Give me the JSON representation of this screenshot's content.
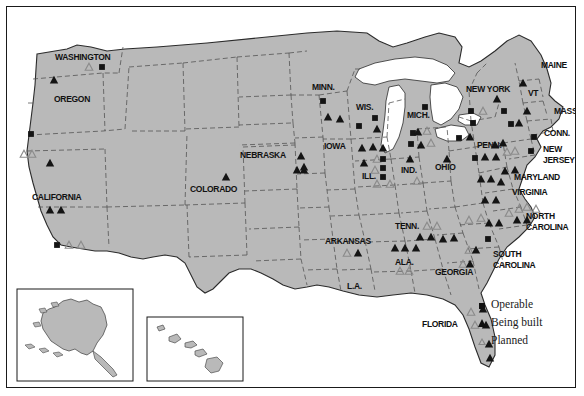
{
  "map": {
    "title": "Nuclear power plants in the United States",
    "land_color": "#b9b9b9",
    "water_color": "#ffffff",
    "outline_color": "#2b2b2b",
    "internal_border_color": "#4d4d4d",
    "frame_color": "#1a1a1a",
    "marker_fill": "#141414",
    "marker_outline": "#8a8a8a"
  },
  "legend": {
    "items": [
      {
        "icon": "filled-square-icon",
        "label": "Operable"
      },
      {
        "icon": "filled-triangle-icon",
        "label": "Being built"
      },
      {
        "icon": "outline-triangle-icon",
        "label": "Planned"
      }
    ]
  },
  "insets": [
    {
      "name": "alaska-inset",
      "label": ""
    },
    {
      "name": "hawaii-inset",
      "label": ""
    }
  ],
  "state_labels": [
    {
      "text": "WASHINGTON",
      "x": 48,
      "y": 53,
      "size": 8.5
    },
    {
      "text": "OREGON",
      "x": 47,
      "y": 95,
      "size": 8.5
    },
    {
      "text": "CALIFORNIA",
      "x": 25,
      "y": 193,
      "size": 8.5
    },
    {
      "text": "COLORADO",
      "x": 183,
      "y": 185,
      "size": 8.5
    },
    {
      "text": "NEBRASKA",
      "x": 233,
      "y": 151,
      "size": 8.5
    },
    {
      "text": "MINN.",
      "x": 305,
      "y": 83,
      "size": 8.5
    },
    {
      "text": "WIS.",
      "x": 349,
      "y": 103,
      "size": 8.5
    },
    {
      "text": "IOWA",
      "x": 317,
      "y": 142,
      "size": 8.5
    },
    {
      "text": "ILL.",
      "x": 355,
      "y": 172,
      "size": 8.5
    },
    {
      "text": "IND.",
      "x": 394,
      "y": 166,
      "size": 8.5
    },
    {
      "text": "OHIO",
      "x": 428,
      "y": 163,
      "size": 8.5
    },
    {
      "text": "MICH.",
      "x": 400,
      "y": 111,
      "size": 8.5
    },
    {
      "text": "ARKANSAS",
      "x": 318,
      "y": 237,
      "size": 8.5
    },
    {
      "text": "L.A.",
      "x": 340,
      "y": 282,
      "size": 8.5
    },
    {
      "text": "TENN.",
      "x": 388,
      "y": 222,
      "size": 8.5
    },
    {
      "text": "ALA.",
      "x": 388,
      "y": 258,
      "size": 8.5
    },
    {
      "text": "GEORGIA",
      "x": 428,
      "y": 268,
      "size": 8.5
    },
    {
      "text": "FLORIDA",
      "x": 415,
      "y": 320,
      "size": 8.5
    },
    {
      "text": "SOUTH",
      "x": 486,
      "y": 250,
      "size": 8.5
    },
    {
      "text": "CAROLINA",
      "x": 486,
      "y": 261,
      "size": 8.5
    },
    {
      "text": "NORTH",
      "x": 519,
      "y": 212,
      "size": 8.5
    },
    {
      "text": "CAROLINA",
      "x": 519,
      "y": 223,
      "size": 8.5
    },
    {
      "text": "VIRGINIA",
      "x": 505,
      "y": 188,
      "size": 8.5
    },
    {
      "text": "MARYLAND",
      "x": 507,
      "y": 173,
      "size": 8.5
    },
    {
      "text": "NEW",
      "x": 536,
      "y": 145,
      "size": 8.5
    },
    {
      "text": "JERSEY",
      "x": 536,
      "y": 156,
      "size": 8.5
    },
    {
      "text": "PENN.",
      "x": 470,
      "y": 141,
      "size": 8.5
    },
    {
      "text": "CONN.",
      "x": 537,
      "y": 129,
      "size": 8.5
    },
    {
      "text": "MASS.",
      "x": 547,
      "y": 107,
      "size": 8.5
    },
    {
      "text": "VT",
      "x": 521,
      "y": 89,
      "size": 8.5
    },
    {
      "text": "NEW YORK",
      "x": 459,
      "y": 85,
      "size": 8.5
    },
    {
      "text": "MAINE",
      "x": 534,
      "y": 61,
      "size": 8.5
    }
  ],
  "markers": [
    {
      "type": "planned",
      "x": 82,
      "y": 60
    },
    {
      "type": "operable",
      "x": 95,
      "y": 60
    },
    {
      "type": "built",
      "x": 47,
      "y": 73
    },
    {
      "type": "operable",
      "x": 24,
      "y": 127
    },
    {
      "type": "planned",
      "x": 17,
      "y": 147
    },
    {
      "type": "planned",
      "x": 25,
      "y": 147
    },
    {
      "type": "built",
      "x": 43,
      "y": 156
    },
    {
      "type": "built",
      "x": 43,
      "y": 203
    },
    {
      "type": "built",
      "x": 54,
      "y": 203
    },
    {
      "type": "operable",
      "x": 50,
      "y": 238
    },
    {
      "type": "planned",
      "x": 62,
      "y": 238
    },
    {
      "type": "planned",
      "x": 74,
      "y": 238
    },
    {
      "type": "built",
      "x": 219,
      "y": 170
    },
    {
      "type": "built",
      "x": 294,
      "y": 149
    },
    {
      "type": "built",
      "x": 297,
      "y": 163
    },
    {
      "type": "operable",
      "x": 316,
      "y": 94
    },
    {
      "type": "built",
      "x": 321,
      "y": 110
    },
    {
      "type": "built",
      "x": 333,
      "y": 112
    },
    {
      "type": "operable",
      "x": 352,
      "y": 119
    },
    {
      "type": "operable",
      "x": 368,
      "y": 111
    },
    {
      "type": "built",
      "x": 370,
      "y": 122
    },
    {
      "type": "built",
      "x": 355,
      "y": 141
    },
    {
      "type": "built",
      "x": 366,
      "y": 140
    },
    {
      "type": "built",
      "x": 376,
      "y": 141
    },
    {
      "type": "built",
      "x": 297,
      "y": 160
    },
    {
      "type": "built",
      "x": 290,
      "y": 163
    },
    {
      "type": "built",
      "x": 357,
      "y": 156
    },
    {
      "type": "planned",
      "x": 370,
      "y": 152
    },
    {
      "type": "operable",
      "x": 376,
      "y": 152
    },
    {
      "type": "operable",
      "x": 376,
      "y": 161
    },
    {
      "type": "operable",
      "x": 376,
      "y": 170
    },
    {
      "type": "planned",
      "x": 368,
      "y": 163
    },
    {
      "type": "planned",
      "x": 370,
      "y": 177
    },
    {
      "type": "planned",
      "x": 383,
      "y": 177
    },
    {
      "type": "built",
      "x": 403,
      "y": 152
    },
    {
      "type": "operable",
      "x": 406,
      "y": 126
    },
    {
      "type": "built",
      "x": 411,
      "y": 125
    },
    {
      "type": "planned",
      "x": 420,
      "y": 124
    },
    {
      "type": "operable",
      "x": 404,
      "y": 137
    },
    {
      "type": "built",
      "x": 414,
      "y": 138
    },
    {
      "type": "planned",
      "x": 424,
      "y": 136
    },
    {
      "type": "operable",
      "x": 418,
      "y": 100
    },
    {
      "type": "planned",
      "x": 410,
      "y": 174
    },
    {
      "type": "built",
      "x": 440,
      "y": 152
    },
    {
      "type": "operable",
      "x": 452,
      "y": 131
    },
    {
      "type": "built",
      "x": 463,
      "y": 130
    },
    {
      "type": "operable",
      "x": 468,
      "y": 151
    },
    {
      "type": "built",
      "x": 478,
      "y": 150
    },
    {
      "type": "built",
      "x": 489,
      "y": 150
    },
    {
      "type": "built",
      "x": 488,
      "y": 138
    },
    {
      "type": "built",
      "x": 496,
      "y": 136
    },
    {
      "type": "planned",
      "x": 500,
      "y": 145
    },
    {
      "type": "planned",
      "x": 508,
      "y": 144
    },
    {
      "type": "operable",
      "x": 464,
      "y": 104
    },
    {
      "type": "planned",
      "x": 476,
      "y": 104
    },
    {
      "type": "operable",
      "x": 466,
      "y": 116
    },
    {
      "type": "built",
      "x": 490,
      "y": 92
    },
    {
      "type": "operable",
      "x": 497,
      "y": 104
    },
    {
      "type": "operable",
      "x": 504,
      "y": 117
    },
    {
      "type": "built",
      "x": 512,
      "y": 116
    },
    {
      "type": "built",
      "x": 520,
      "y": 104
    },
    {
      "type": "built",
      "x": 516,
      "y": 76
    },
    {
      "type": "operable",
      "x": 527,
      "y": 130
    },
    {
      "type": "operable",
      "x": 524,
      "y": 144
    },
    {
      "type": "built",
      "x": 498,
      "y": 164
    },
    {
      "type": "built",
      "x": 508,
      "y": 163
    },
    {
      "type": "built",
      "x": 474,
      "y": 172
    },
    {
      "type": "built",
      "x": 484,
      "y": 172
    },
    {
      "type": "built",
      "x": 494,
      "y": 175
    },
    {
      "type": "built",
      "x": 478,
      "y": 193
    },
    {
      "type": "built",
      "x": 489,
      "y": 193
    },
    {
      "type": "planned",
      "x": 502,
      "y": 206
    },
    {
      "type": "planned",
      "x": 512,
      "y": 202
    },
    {
      "type": "planned",
      "x": 520,
      "y": 200
    },
    {
      "type": "planned",
      "x": 529,
      "y": 202
    },
    {
      "type": "built",
      "x": 510,
      "y": 213
    },
    {
      "type": "built",
      "x": 520,
      "y": 213
    },
    {
      "type": "planned",
      "x": 462,
      "y": 213
    },
    {
      "type": "planned",
      "x": 474,
      "y": 211
    },
    {
      "type": "built",
      "x": 482,
      "y": 216
    },
    {
      "type": "built",
      "x": 492,
      "y": 216
    },
    {
      "type": "operable",
      "x": 481,
      "y": 232
    },
    {
      "type": "planned",
      "x": 462,
      "y": 243
    },
    {
      "type": "built",
      "x": 469,
      "y": 243
    },
    {
      "type": "planned",
      "x": 456,
      "y": 257
    },
    {
      "type": "built",
      "x": 463,
      "y": 257
    },
    {
      "type": "planned",
      "x": 420,
      "y": 219
    },
    {
      "type": "planned",
      "x": 430,
      "y": 219
    },
    {
      "type": "built",
      "x": 413,
      "y": 230
    },
    {
      "type": "built",
      "x": 424,
      "y": 230
    },
    {
      "type": "built",
      "x": 436,
      "y": 232
    },
    {
      "type": "built",
      "x": 447,
      "y": 231
    },
    {
      "type": "built",
      "x": 388,
      "y": 241
    },
    {
      "type": "built",
      "x": 398,
      "y": 241
    },
    {
      "type": "built",
      "x": 409,
      "y": 241
    },
    {
      "type": "planned",
      "x": 393,
      "y": 264
    },
    {
      "type": "planned",
      "x": 402,
      "y": 264
    },
    {
      "type": "planned",
      "x": 340,
      "y": 246
    },
    {
      "type": "built",
      "x": 351,
      "y": 246
    },
    {
      "type": "planned",
      "x": 464,
      "y": 305
    },
    {
      "type": "built",
      "x": 476,
      "y": 302
    },
    {
      "type": "planned",
      "x": 468,
      "y": 318
    },
    {
      "type": "built",
      "x": 479,
      "y": 318
    },
    {
      "type": "built",
      "x": 482,
      "y": 337
    },
    {
      "type": "built",
      "x": 483,
      "y": 351
    }
  ]
}
